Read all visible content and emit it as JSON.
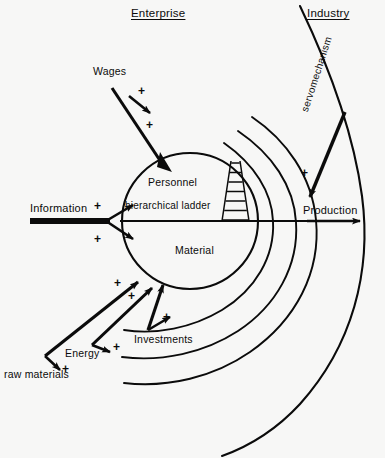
{
  "diagram": {
    "type": "schematic-diagram",
    "background_color": "#f7f7f6",
    "ink_color": "#0b0b0b",
    "regions": {
      "enterprise_label": "Enterprise",
      "industry_label": "Industry"
    },
    "core": {
      "upper_half_label": "Personnel",
      "upper_half_sublabel": "hierarchical ladder",
      "lower_half_label": "Material",
      "icon": "ladder-icon"
    },
    "inputs": [
      {
        "name": "wages",
        "label": "Wages",
        "sign": "+",
        "arrowheads": 2
      },
      {
        "name": "information",
        "label": "Information",
        "sign": "+",
        "arrowheads": 2
      },
      {
        "name": "investments",
        "label": "Investments",
        "sign": "+",
        "arrowheads": 2
      },
      {
        "name": "energy",
        "label": "Energy",
        "sign": "+",
        "arrowheads": 2
      },
      {
        "name": "raw-materials",
        "label": "raw materials",
        "sign": "+",
        "arrowheads": 2
      }
    ],
    "outputs": [
      {
        "name": "production",
        "label": "Production"
      },
      {
        "name": "servomechanism",
        "label": "servomechanism",
        "sign": "+"
      }
    ],
    "signs": {
      "plus": "+"
    },
    "spiral": {
      "arc_count": 4,
      "description": "concentric spiral arcs expanding clockwise from the core out to the industry boundary"
    }
  }
}
